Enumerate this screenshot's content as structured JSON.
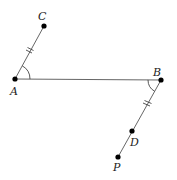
{
  "diagram": {
    "type": "geometry",
    "points": {
      "A": {
        "label": "A",
        "x": 15,
        "y": 79
      },
      "B": {
        "label": "B",
        "x": 161,
        "y": 80
      },
      "C": {
        "label": "C",
        "x": 44,
        "y": 26
      },
      "D": {
        "label": "D",
        "x": 132,
        "y": 131
      },
      "P": {
        "label": "P",
        "x": 118,
        "y": 157
      }
    },
    "segments": [
      "AC",
      "AB",
      "BP"
    ],
    "equal_marks": [
      "AC",
      "BD"
    ],
    "angle_marks": [
      "CAB",
      "ABD"
    ],
    "colors": {
      "line": "#555555",
      "point": "#000000",
      "label": "#222222"
    }
  }
}
